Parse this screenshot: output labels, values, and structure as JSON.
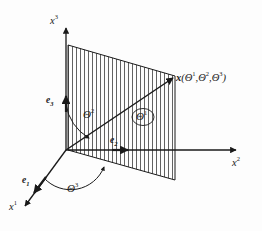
{
  "figure": {
    "type": "3d-coordinate-diagram",
    "background_color": "#fdfdfd",
    "line_color": "#1a1a1a",
    "hatch_color": "#333333"
  },
  "axes": [
    {
      "id": "x1",
      "label_base": "x",
      "label_sup": "1",
      "direction": "lower-left"
    },
    {
      "id": "x2",
      "label_base": "x",
      "label_sup": "2",
      "direction": "right"
    },
    {
      "id": "x3",
      "label_base": "x",
      "label_sup": "3",
      "direction": "up"
    }
  ],
  "basis_vectors": [
    {
      "id": "e1",
      "label_base": "e",
      "label_sub": "1"
    },
    {
      "id": "e2",
      "label_base": "e",
      "label_sub": "2"
    },
    {
      "id": "e3",
      "label_base": "e",
      "label_sub": "3"
    }
  ],
  "angles": [
    {
      "id": "theta1",
      "symbol": "Θ",
      "sup": "1",
      "note": "angle of position vector within the hatched plane"
    },
    {
      "id": "theta2",
      "symbol": "Θ",
      "sup": "2",
      "note": "polar angle measured from the x3 axis"
    },
    {
      "id": "theta3",
      "symbol": "Θ",
      "sup": "3",
      "note": "azimuthal angle measured from the x1 axis"
    }
  ],
  "point": {
    "vector_symbol": "x",
    "open_paren": "(",
    "close_paren": ")",
    "sep": ",",
    "arg1_symbol": "Θ",
    "arg1_sup": "1",
    "arg2_symbol": "Θ",
    "arg2_sup": "2",
    "arg3_symbol": "Θ",
    "arg3_sup": "3"
  },
  "plane": {
    "name": "hatched-plane",
    "fill": "none",
    "hatch_orientation": "vertical",
    "hatch_spacing_px": 4
  }
}
